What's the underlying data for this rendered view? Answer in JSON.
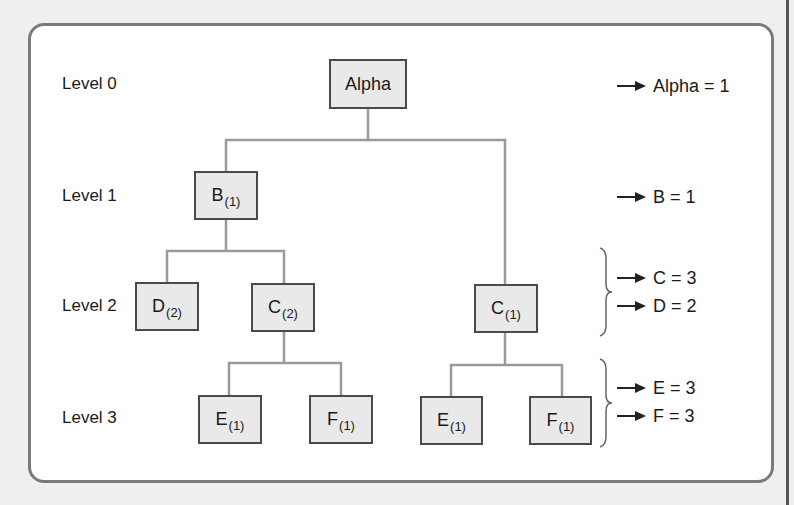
{
  "diagram": {
    "levels": [
      {
        "label": "Level 0"
      },
      {
        "label": "Level 1"
      },
      {
        "label": "Level 2"
      },
      {
        "label": "Level 3"
      }
    ],
    "nodes": [
      {
        "id": "alpha",
        "name": "Alpha",
        "sub": ""
      },
      {
        "id": "b1",
        "name": "B",
        "sub": "(1)"
      },
      {
        "id": "d2",
        "name": "D",
        "sub": "(2)"
      },
      {
        "id": "c2",
        "name": "C",
        "sub": "(2)"
      },
      {
        "id": "c1",
        "name": "C",
        "sub": "(1)"
      },
      {
        "id": "e1_left",
        "name": "E",
        "sub": "(1)"
      },
      {
        "id": "f1_left",
        "name": "F",
        "sub": "(1)"
      },
      {
        "id": "e1_right",
        "name": "E",
        "sub": "(1)"
      },
      {
        "id": "f1_right",
        "name": "F",
        "sub": "(1)"
      }
    ],
    "edges": [
      [
        "alpha",
        "b1"
      ],
      [
        "alpha",
        "c1"
      ],
      [
        "b1",
        "d2"
      ],
      [
        "b1",
        "c2"
      ],
      [
        "c2",
        "e1_left"
      ],
      [
        "c2",
        "f1_left"
      ],
      [
        "c1",
        "e1_right"
      ],
      [
        "c1",
        "f1_right"
      ]
    ],
    "results": [
      {
        "text": "Alpha = 1"
      },
      {
        "text": "B = 1"
      },
      {
        "text": "C = 3"
      },
      {
        "text": "D = 2"
      },
      {
        "text": "E = 3"
      },
      {
        "text": "F = 3"
      }
    ],
    "colors": {
      "node_fill": "#e9e9e9",
      "node_border": "#4a4a4a",
      "connector": "#9a9a9a",
      "panel_border": "#7a7a7a",
      "background": "#efefef"
    }
  }
}
